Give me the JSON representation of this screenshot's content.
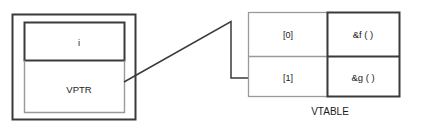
{
  "diagram": {
    "colors": {
      "stroke_dark": "#3a3a3a",
      "stroke_light": "#9a9a9a",
      "text": "#1a1a1a",
      "background": "#ffffff"
    },
    "object_box": {
      "name": "object-instance",
      "fields": [
        {
          "label": "i",
          "icon": "data-member-cell"
        },
        {
          "label": "VPTR",
          "icon": "vptr-cell"
        }
      ]
    },
    "connector": {
      "name": "vptr-to-vtable-pointer",
      "from": "VPTR",
      "to": "[1]"
    },
    "vtable": {
      "caption": "VTABLE",
      "rows": [
        {
          "index": "[0]",
          "entry": "&f ( )"
        },
        {
          "index": "[1]",
          "entry": "&g ( )"
        }
      ]
    }
  }
}
